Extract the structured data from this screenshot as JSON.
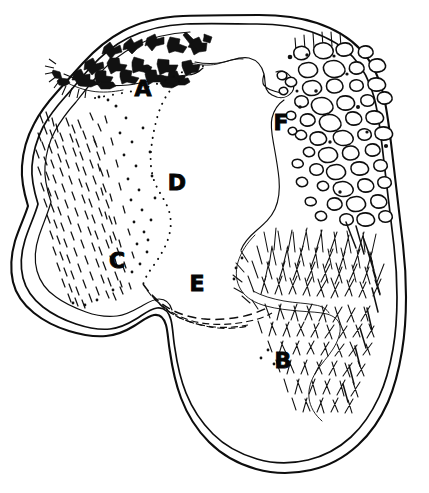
{
  "figure": {
    "kind": "hand-drawn-plan-diagram",
    "title": "",
    "caption": "",
    "background_color": "#ffffff",
    "ink_color": "#0d0d0d",
    "width": 429,
    "height": 493
  },
  "labels": [
    {
      "id": "A",
      "text": "A",
      "x": 143,
      "y": 96,
      "zone": "debris-scatter-zone",
      "texture": "dark-irregular-flakes"
    },
    {
      "id": "F",
      "text": "F",
      "x": 281,
      "y": 130,
      "zone": "cobble-stone-zone",
      "texture": "pebble-outlines"
    },
    {
      "id": "D",
      "text": "D",
      "x": 177,
      "y": 190,
      "zone": "dotted-boundary-zone",
      "texture": "dotted-line"
    },
    {
      "id": "C",
      "text": "C",
      "x": 117,
      "y": 268,
      "zone": "dense-dash-zone",
      "texture": "short-dashes"
    },
    {
      "id": "E",
      "text": "E",
      "x": 197,
      "y": 291,
      "zone": "dashed-band-zone",
      "texture": "dashed-band"
    },
    {
      "id": "B",
      "text": "B",
      "x": 283,
      "y": 368,
      "zone": "bristle-grass-zone",
      "texture": "long-hair-strokes"
    }
  ],
  "paths": {
    "outer_outline": "M 181 17 C 146 21 120 33 101 49 C 84 63 74 75 67 84 C 56 97 48 106 41 120 C 33 136 29 152 28 168 C 27 184 30 196 33 210 C 37 228 43 246 50 264 C 57 282 64 298 73 311 C 82 324 93 331 106 333 C 119 335 132 331 141 324 C 150 317 155 311 161 311 C 167 311 171 318 173 327 C 176 340 177 355 180 372 C 183 389 188 406 197 421 C 206 436 219 448 236 457 C 253 466 272 470 291 468 C 310 466 327 458 342 446 C 357 434 368 419 377 402 C 386 385 392 367 396 348 C 400 329 402 310 402 291 C 402 272 400 254 398 236 C 396 218 394 200 392 182 C 390 164 388 146 385 128 C 382 110 378 92 371 77 C 364 62 353 49 338 39 C 323 29 304 22 283 19 C 262 16 240 15 222 15 C 204 15 192 16 181 17 Z",
    "inner_outline": "M 182 24 C 149 28 125 39 107 54 C 91 67 81 79 74 88 C 64 100 56 110 50 123 C 43 138 39 153 38 168 C 37 183 40 195 43 208 C 47 225 53 242 60 259 C 67 276 74 291 82 303 C 90 315 100 321 111 323 C 122 325 133 321 141 315 C 149 309 154 303 161 303 C 169 303 174 311 176 321 C 179 334 181 350 184 367 C 187 384 192 400 200 414 C 208 428 220 439 235 447 C 250 455 267 459 285 457 C 303 455 318 448 332 437 C 346 426 356 412 364 396 C 372 380 378 363 382 345 C 386 327 388 309 388 291 C 388 273 386 256 384 238 C 382 220 380 203 378 185 C 376 167 374 150 371 133 C 368 116 364 99 358 85 C 351 71 341 59 327 50 C 313 41 296 35 277 32 C 258 29 238 28 221 28 C 204 28 192 29 182 24 Z",
    "inner_outline2": "M 184 31 C 153 35 130 46 113 60 C 98 72 88 84 81 93 C 72 104 64 114 58 126 C 52 140 48 154 47 168 C 46 182 49 193 52 206 C 56 222 62 238 69 254 C 76 270 82 284 90 295 C 97 306 106 312 116 314 C 126 316 136 312 143 306 C 151 300 156 295 162 295",
    "boundary_A_main": "M 79 79 C 92 80 104 82 114 83 C 126 84 136 84 147 83 C 158 82 168 80 178 79 C 188 78 197 77 205 77",
    "boundary_F": "M 197 62 C 213 63 228 62 242 61 C 256 60 266 58 274 61 C 282 64 286 70 288 79 C 290 88 288 96 283 103 C 278 110 272 115 270 124 C 268 133 270 143 272 154 C 274 165 276 176 277 187 C 278 198 277 208 273 216 C 269 224 262 229 256 235",
    "boundary_D": "M 198 67 C 186 74 176 83 170 94 C 164 105 162 117 159 128 C 156 139 152 149 150 160 C 148 171 148 182 152 192 C 156 202 163 210 166 220 C 169 230 168 242 164 252 C 160 262 153 270 148 277",
    "boundary_E_top": "M 147 277 C 155 287 164 296 175 302 C 186 308 198 311 210 312 C 222 313 234 312 245 310 C 256 308 266 305 274 302",
    "boundary_E_bot": "M 149 284 C 157 294 167 303 178 309 C 189 315 201 318 213 319 C 225 320 237 319 248 317 C 259 315 269 312 277 309",
    "boundary_E_bot2": "M 152 290 C 160 300 170 308 181 314 C 192 320 204 323 216 324 C 228 325 240 324 250 322",
    "boundary_B": "M 258 237 C 250 245 243 254 240 264 C 237 274 238 284 243 292 C 248 300 257 305 268 308 C 279 311 291 312 302 313 C 313 314 323 314 331 316 C 339 318 344 322 346 329 C 348 336 346 344 341 352 C 336 360 329 367 324 375 C 319 383 316 392 317 401 C 318 410 323 418 330 424",
    "boundary_C_inner": "M 73 88 C 79 100 83 113 86 126 C 89 139 91 152 93 165"
  }
}
